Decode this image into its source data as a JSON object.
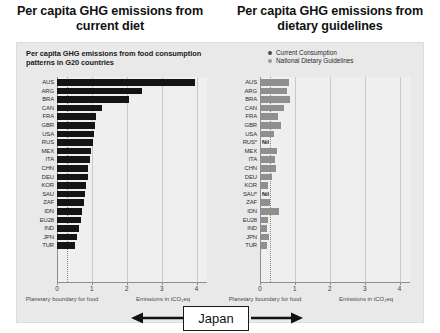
{
  "slide": {
    "left_title": "Per capita GHG emissions from current diet",
    "right_title": "Per capita GHG emissions from dietary guidelines",
    "callout_label": "Japan",
    "callout_arrow_left": "arrow-left-icon",
    "callout_arrow_right": "arrow-right-icon"
  },
  "left_panel": {
    "heading": "Per capita GHG emissions from food consumption patterns in G20 countries",
    "axis_title": "Emissions in tCO₂eq",
    "boundary_note": "Planetary boundary for food",
    "tick_labels": [
      "0",
      "1",
      "2",
      "3",
      "4"
    ]
  },
  "right_panel": {
    "legend": [
      {
        "label": "Current Consumption",
        "color": "#4a4a4a",
        "marker": "legend-dot-current"
      },
      {
        "label": "National Dietary Guidelines",
        "color": "#9a9a9a",
        "marker": "legend-dot-guidelines"
      }
    ],
    "axis_title": "Emissions in tCO₂eq",
    "boundary_note": "Planetary boundary for food",
    "tick_labels": [
      "0",
      "1",
      "2",
      "3",
      "4"
    ],
    "nil_label": "Nil"
  },
  "chart_data": [
    {
      "id": "current-diet",
      "type": "bar",
      "orientation": "horizontal",
      "title": "Per capita GHG emissions from food consumption patterns in G20 countries",
      "xlabel": "Emissions in tCO₂eq",
      "ylabel": "",
      "xlim": [
        0,
        4.3
      ],
      "xticks": [
        0,
        1,
        2,
        3,
        4
      ],
      "grid": true,
      "bar_color": "#141414",
      "annotation_line": {
        "label": "Planetary boundary for food",
        "value": 0.3,
        "style": "dotted"
      },
      "categories": [
        "AUS",
        "ARG",
        "BRA",
        "CAN",
        "FRA",
        "GBR",
        "USA",
        "RUS",
        "MEX",
        "ITA",
        "CHN",
        "DEU",
        "KOR",
        "SAU",
        "ZAF",
        "IDN",
        "EU28",
        "IND",
        "JPN",
        "TUR"
      ],
      "values": [
        3.95,
        2.45,
        2.05,
        1.28,
        1.12,
        1.08,
        1.05,
        1.02,
        0.98,
        0.95,
        0.9,
        0.88,
        0.82,
        0.8,
        0.76,
        0.72,
        0.68,
        0.62,
        0.58,
        0.52
      ]
    },
    {
      "id": "dietary-guidelines",
      "type": "bar",
      "orientation": "horizontal",
      "title": "Per capita GHG emissions from dietary guidelines",
      "xlabel": "Emissions in tCO₂eq",
      "ylabel": "",
      "xlim": [
        0,
        4.3
      ],
      "xticks": [
        0,
        1,
        2,
        3,
        4
      ],
      "grid": true,
      "bar_color": "#8f8f8f",
      "annotation_line": {
        "label": "Planetary boundary for food",
        "value": 0.3,
        "style": "dotted"
      },
      "categories": [
        "AUS",
        "ARG",
        "BRA",
        "CAN",
        "FRA",
        "GBR",
        "USA",
        "RUS*",
        "MEX",
        "ITA",
        "CHN",
        "DEU",
        "KOR",
        "SAU*",
        "ZAF",
        "IDN",
        "EU28",
        "IND",
        "JPN",
        "TUR"
      ],
      "values": [
        0.82,
        0.78,
        0.86,
        0.7,
        0.52,
        0.6,
        0.4,
        null,
        0.48,
        0.44,
        0.47,
        0.35,
        0.22,
        null,
        0.28,
        0.55,
        0.24,
        0.2,
        0.26,
        0.21
      ],
      "nil_markers": [
        "RUS*",
        "SAU*"
      ]
    }
  ]
}
